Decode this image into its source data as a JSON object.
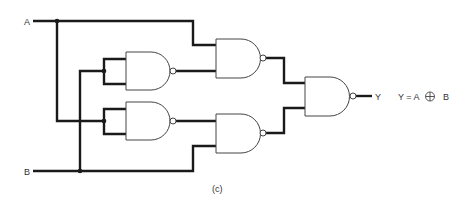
{
  "diagram": {
    "type": "logic-circuit",
    "inputs": [
      {
        "label": "A"
      },
      {
        "label": "B"
      }
    ],
    "output": {
      "label": "Y"
    },
    "equation": {
      "lhs": "Y = A",
      "operator": "⊕",
      "rhs": "B"
    },
    "caption": "(c)",
    "gates": [
      {
        "id": "G1",
        "type": "NAND",
        "inputs": [
          "B",
          "B"
        ]
      },
      {
        "id": "G2",
        "type": "NAND",
        "inputs": [
          "A",
          "G1"
        ]
      },
      {
        "id": "G3",
        "type": "NAND",
        "inputs": [
          "A",
          "A"
        ]
      },
      {
        "id": "G4",
        "type": "NAND",
        "inputs": [
          "G3",
          "B"
        ]
      },
      {
        "id": "G5",
        "type": "NAND",
        "inputs": [
          "G2",
          "G4"
        ]
      }
    ],
    "colors": {
      "wire": "#1a1a1a",
      "gate_outline": "#444444",
      "background": "#ffffff"
    }
  }
}
